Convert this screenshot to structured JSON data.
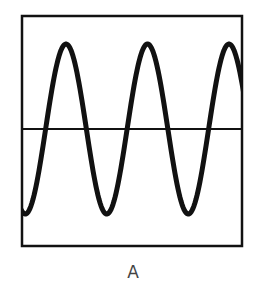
{
  "figure": {
    "label": "A",
    "frame": {
      "x": 22,
      "y": 16,
      "width": 220,
      "height": 230
    },
    "midline_y": 129,
    "wave": {
      "peak_y": 44,
      "trough_y": 214,
      "period_px": 81.5,
      "phase_start": "trough at left edge",
      "cycles_visible": 2.7
    },
    "colors": {
      "stroke": "#111111",
      "label": "#444444",
      "background": "#ffffff"
    }
  }
}
